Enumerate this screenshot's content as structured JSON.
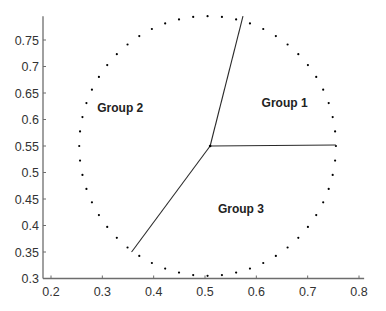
{
  "chart_data": {
    "type": "scatter",
    "title": "",
    "xlabel": "",
    "ylabel": "",
    "xlim": [
      0.19,
      0.81
    ],
    "ylim": [
      0.3,
      0.795
    ],
    "grid": false,
    "xticks": [
      0.2,
      0.3,
      0.4,
      0.5,
      0.6,
      0.7,
      0.8
    ],
    "xtick_labels": [
      "0.2",
      "0.3",
      "0.4",
      "0.5",
      "0.6",
      "0.7",
      "0.8"
    ],
    "yticks": [
      0.3,
      0.35,
      0.4,
      0.45,
      0.5,
      0.55,
      0.6,
      0.65,
      0.7,
      0.75
    ],
    "ytick_labels": [
      "0.3",
      "0.35",
      "0.4",
      "0.45",
      "0.5",
      "0.55",
      "0.6",
      "0.65",
      "0.7",
      "0.75"
    ],
    "circle": {
      "cx": 0.505,
      "cy": 0.55,
      "rx": 0.25,
      "ry": 0.245,
      "n_points": 56
    },
    "center": [
      0.51,
      0.55
    ],
    "boundary_segments": [
      {
        "from": [
          0.51,
          0.55
        ],
        "to": [
          0.574,
          0.795
        ]
      },
      {
        "from": [
          0.51,
          0.55
        ],
        "to": [
          0.755,
          0.552
        ]
      },
      {
        "from": [
          0.51,
          0.55
        ],
        "to": [
          0.357,
          0.35
        ]
      }
    ],
    "annotations": [
      {
        "text": "Group 1",
        "x": 0.655,
        "y": 0.632
      },
      {
        "text": "Group 2",
        "x": 0.335,
        "y": 0.621
      },
      {
        "text": "Group 3",
        "x": 0.57,
        "y": 0.431
      }
    ],
    "point_color": "#000000",
    "line_color": "#000000"
  }
}
